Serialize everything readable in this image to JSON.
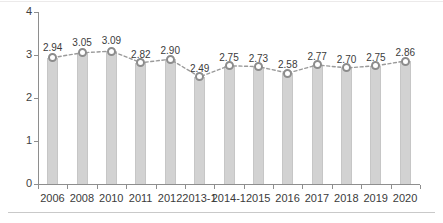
{
  "chart_data": {
    "type": "bar",
    "title": "",
    "subtitle": "",
    "xlabel": "",
    "ylabel": "",
    "categories": [
      "2006",
      "2008",
      "2010",
      "2011",
      "2012",
      "2013-1",
      "2014-1",
      "2015",
      "2016",
      "2017",
      "2018",
      "2019",
      "2020"
    ],
    "values": [
      2.94,
      3.05,
      3.09,
      2.82,
      2.9,
      2.49,
      2.75,
      2.73,
      2.58,
      2.77,
      2.7,
      2.75,
      2.86
    ],
    "data_labels": [
      "2.94",
      "3.05",
      "3.09",
      "2.82",
      "2.90",
      "2.49",
      "2.75",
      "2.73",
      "2.58",
      "2.77",
      "2.70",
      "2.75",
      "2.86"
    ],
    "ylim": [
      0,
      4
    ],
    "ytick_labels": [
      "0",
      "1",
      "2",
      "3",
      "4"
    ],
    "ytick_values": [
      0,
      1,
      2,
      3,
      4
    ],
    "grid": false,
    "legend": false,
    "legend_position": "none",
    "overlay_series": {
      "name": "",
      "type": "line",
      "style": "dashed",
      "marker": "circle-open",
      "values": [
        2.94,
        3.05,
        3.09,
        2.82,
        2.9,
        2.49,
        2.75,
        2.73,
        2.58,
        2.77,
        2.7,
        2.75,
        2.86
      ]
    }
  },
  "colors": {
    "bar_fill": "#d2d2d2",
    "bar_edge": "#c6c6c6",
    "axis": "#8e8e8e",
    "marker_edge": "#8c8c8c",
    "marker_fill": "#ffffff",
    "line": "#9a9a9a",
    "text": "#3b3b3b",
    "background": "#ffffff",
    "separator": "#c9c9c9"
  }
}
